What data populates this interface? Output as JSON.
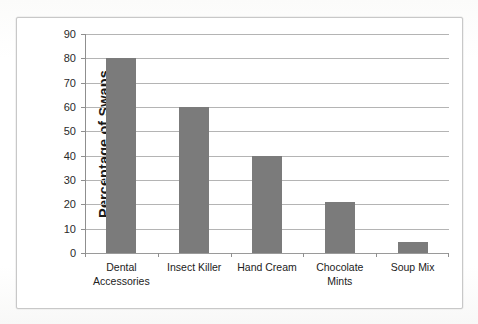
{
  "chart_data": {
    "type": "bar",
    "title": "",
    "subtitle": "",
    "xlabel": "",
    "ylabel": "Percentage of Swaps",
    "categories": [
      "Dental Accessories",
      "Insect Killer",
      "Hand Cream",
      "Chocolate Mints",
      "Soup Mix"
    ],
    "category_lines": [
      [
        "Dental",
        "Accessories"
      ],
      [
        "Insect Killer"
      ],
      [
        "Hand Cream"
      ],
      [
        "Chocolate",
        "Mints"
      ],
      [
        "Soup Mix"
      ]
    ],
    "values": [
      80,
      60,
      40,
      21,
      4.5
    ],
    "ylim": [
      0,
      90
    ],
    "ytick_step": 10,
    "yticks": [
      0,
      10,
      20,
      30,
      40,
      50,
      60,
      70,
      80,
      90
    ],
    "ytick_labels": [
      "0",
      "10",
      "20",
      "30",
      "40",
      "50",
      "60",
      "70",
      "80",
      "90"
    ],
    "grid": true,
    "grid_axis": "y",
    "legend": false,
    "legend_position": "none",
    "bar_color": "#7b7b7b",
    "gridline_color": "#b4b4b4",
    "axis_color": "#8f8f8f",
    "plot_background": "#ffffff",
    "frame_border_color": "#c8c8c8"
  }
}
